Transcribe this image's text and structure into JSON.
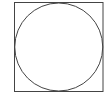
{
  "diagram": {
    "shapes": [
      {
        "type": "square",
        "x": 14,
        "y": 2,
        "width": 89,
        "height": 89,
        "stroke": "#444444"
      },
      {
        "type": "circle",
        "cx": 58.5,
        "cy": 46.5,
        "r": 44,
        "stroke": "#444444"
      }
    ]
  }
}
